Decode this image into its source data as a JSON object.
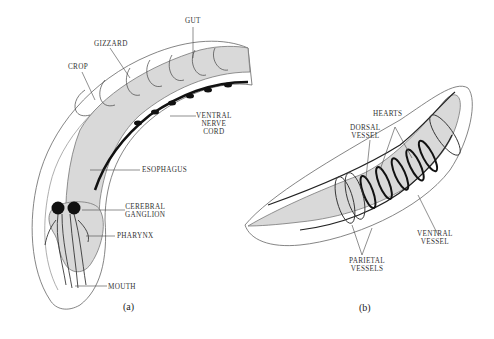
{
  "figure_a": {
    "caption": "(a)",
    "labels": {
      "gut": "GUT",
      "gizzard": "GIZZARD",
      "crop": "CROP",
      "ventral_nerve_cord_1": "VENTRAL",
      "ventral_nerve_cord_2": "NERVE",
      "ventral_nerve_cord_3": "CORD",
      "esophagus": "ESOPHAGUS",
      "cerebral_ganglion_1": "CEREBRAL",
      "cerebral_ganglion_2": "GANGLION",
      "pharynx": "PHARYNX",
      "mouth": "MOUTH"
    }
  },
  "figure_b": {
    "caption": "(b)",
    "labels": {
      "hearts": "HEARTS",
      "dorsal_vessel_1": "DORSAL",
      "dorsal_vessel_2": "VESSEL",
      "ventral_vessel_1": "VENTRAL",
      "ventral_vessel_2": "VESSEL",
      "parietal_vessels_1": "PARIETAL",
      "parietal_vessels_2": "VESSELS"
    }
  },
  "colors": {
    "outline": "#555555",
    "gut_fill": "#d9d9d9",
    "nerve": "#111111"
  }
}
